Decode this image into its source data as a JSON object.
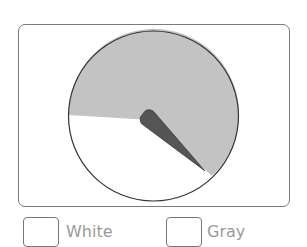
{
  "spinner": {
    "sections": [
      {
        "name": "White",
        "color": "#ffffff"
      },
      {
        "name": "Gray",
        "color": "#c3c3c3"
      }
    ],
    "pointer_color": "#555555",
    "outline_color": "#333333"
  },
  "legend": {
    "items": [
      {
        "label": "White",
        "swatch_color": "#ffffff"
      },
      {
        "label": "Gray",
        "swatch_color": "#ffffff"
      }
    ]
  }
}
